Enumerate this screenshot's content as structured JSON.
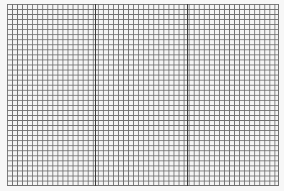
{
  "image": {
    "description": "graph paper grid",
    "grid": {
      "left": 7,
      "top": 4,
      "width": 272,
      "height": 182,
      "cell_size_px": 5,
      "line_color": "#6f6f6f",
      "major_line_color": "#3a3a3a",
      "background_color": "#f4f4f4"
    },
    "major_vertical_lines_x": [
      95,
      187
    ]
  }
}
